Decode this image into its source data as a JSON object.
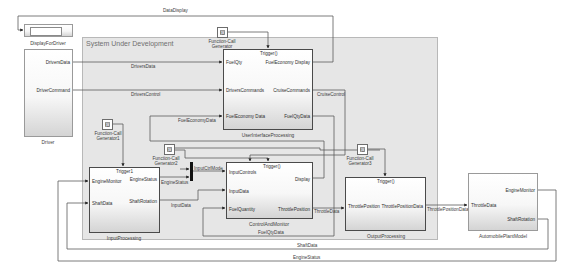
{
  "diagram": {
    "subsystem_area": {
      "title": "System Under Development"
    },
    "blocks": {
      "display_for_driver": {
        "label": "DisplayForDriver"
      },
      "driver": {
        "label": "Driver",
        "outputs": [
          "DriversData",
          "DriverCommand"
        ]
      },
      "user_interface_processing": {
        "label": "UserInterfaceProcessing",
        "trigger": "Trigger()",
        "inputs": [
          "FuelQty",
          "DriversCommands",
          "FuelEconomy Data"
        ],
        "outputs": [
          "FuelEconomy Display",
          "CruiseCommands",
          "FuelQtyData"
        ]
      },
      "input_processing": {
        "label": "InputProcessing",
        "trigger": "Trigger1",
        "inputs": [
          "EngineMonitor",
          "ShaftData"
        ],
        "outputs": [
          "EngineStatus",
          "ShaftRotation"
        ]
      },
      "control_and_monitor": {
        "label": "ControlAndMonitor",
        "trigger": "Trigger()",
        "inputs": [
          "InputControls",
          "InputData",
          "FuelQuantity"
        ],
        "outputs": [
          "Display",
          "ThrottlePosition"
        ]
      },
      "output_processing": {
        "label": "OutputProcessing",
        "trigger": "Trigger()",
        "inputs": [
          "ThrottlePosition"
        ],
        "outputs": [
          "ThrottlePositionData"
        ]
      },
      "automobile_plant_model": {
        "label": "AutomobilePlantModel",
        "inputs": [
          "ThrottleData"
        ],
        "outputs": [
          "EngineMonitor",
          "ShaftRotation"
        ]
      }
    },
    "function_call_generators": [
      {
        "id": "fcg",
        "icon_text": "f()",
        "label_line1": "Function-Call",
        "label_line2": "Generator"
      },
      {
        "id": "fcg1",
        "icon_text": "f()",
        "label_line1": "Function-Call",
        "label_line2": "Generator1"
      },
      {
        "id": "fcg2",
        "icon_text": "f()",
        "label_line1": "Function-Call",
        "label_line2": "Generator2"
      },
      {
        "id": "fcg3",
        "icon_text": "f()",
        "label_line1": "Function-Call",
        "label_line2": "Generator3"
      }
    ],
    "signals": {
      "data_display": "DataDisplay",
      "drivers_data": "DriversData",
      "drivers_control": "DriversControl",
      "cruise_control": "CruiseControl",
      "fuel_economy_data": "FuelEconomyData",
      "fuel_qty_data_top": "FuelQtyData",
      "engine_status": "EngineStatus",
      "input_ctrl_mode": "InputCtrlMode",
      "input_data": "InputData",
      "throttle_data": "ThrottleData",
      "throttle_position_data": "ThrottlePositionData",
      "fuel_qty_data_bottom": "FuelQtyData",
      "shaft_data": "ShaftData",
      "engine_status_bottom": "EngineStatus"
    },
    "colors": {
      "background": "#ffffff",
      "subsystem_fill": "#e6e6e6",
      "wire": "#5a5a5a",
      "block_border": "#4a4a4a"
    }
  }
}
